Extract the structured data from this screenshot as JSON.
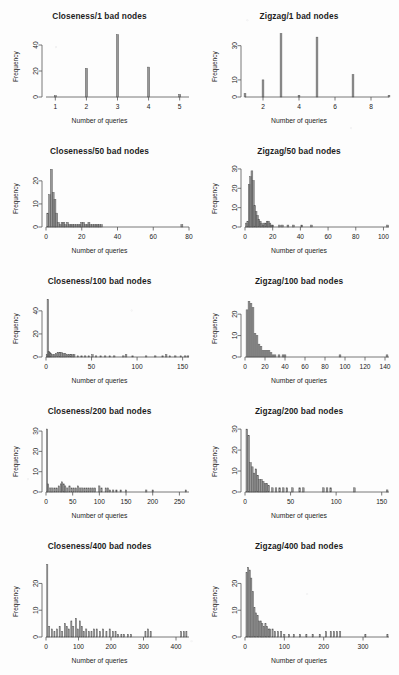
{
  "figure": {
    "axis_color": "#555555",
    "bar_color": "#6f6f6f",
    "background": "#fdfdfd",
    "xlabel": "Number of queries",
    "ylabel": "Frequency"
  },
  "chart_data": [
    {
      "type": "bar",
      "title": "Closeness/1 bad nodes",
      "xlabel": "Number of queries",
      "ylabel": "Frequency",
      "xticks": [
        1,
        2,
        3,
        4,
        5
      ],
      "yticks": [
        0,
        20,
        40
      ],
      "xlim": [
        0.7,
        5.3
      ],
      "ylim": [
        0,
        50
      ],
      "bar_width": 0.07,
      "x": [
        1,
        2,
        3,
        4,
        5
      ],
      "values": [
        1,
        22,
        48,
        23,
        2
      ],
      "grid": false,
      "legend": "none"
    },
    {
      "type": "bar",
      "title": "Zigzag/1 bad nodes",
      "xlabel": "Number of queries",
      "ylabel": "Frequency",
      "xticks": [
        2,
        4,
        6,
        8
      ],
      "yticks": [
        0,
        10,
        30
      ],
      "xlim": [
        1,
        9
      ],
      "ylim": [
        0,
        38
      ],
      "bar_width": 0.1,
      "x": [
        1,
        2,
        3,
        4,
        5,
        7,
        9
      ],
      "values": [
        2,
        10,
        37,
        1,
        35,
        13,
        1
      ],
      "grid": false,
      "legend": "none"
    },
    {
      "type": "bar",
      "title": "Closeness/50 bad nodes",
      "xlabel": "Number of queries",
      "ylabel": "Frequency",
      "xticks": [
        0,
        20,
        40,
        60,
        80
      ],
      "yticks": [
        0,
        10,
        20
      ],
      "xlim": [
        0,
        80
      ],
      "ylim": [
        0,
        26
      ],
      "bar_width": 1.1,
      "x": [
        1,
        2,
        3,
        4,
        5,
        6,
        7,
        8,
        9,
        10,
        11,
        12,
        13,
        14,
        15,
        16,
        17,
        18,
        19,
        20,
        21,
        22,
        23,
        24,
        25,
        26,
        27,
        28,
        29,
        30,
        31,
        76
      ],
      "values": [
        6,
        14,
        25,
        15,
        12,
        6,
        2,
        1,
        2,
        2,
        1,
        2,
        1,
        1,
        1,
        1,
        1,
        1,
        1,
        2,
        2,
        1,
        1,
        2,
        1,
        1,
        1,
        1,
        1,
        1,
        1,
        1
      ],
      "grid": false,
      "legend": "none"
    },
    {
      "type": "bar",
      "title": "Zigzag/50 bad nodes",
      "xlabel": "Number of queries",
      "ylabel": "Frequency",
      "xticks": [
        0,
        20,
        40,
        60,
        80,
        100
      ],
      "yticks": [
        0,
        10,
        20,
        30
      ],
      "xlim": [
        0,
        104
      ],
      "ylim": [
        0,
        31
      ],
      "bar_width": 1.3,
      "x": [
        1,
        2,
        3,
        4,
        5,
        6,
        7,
        8,
        9,
        10,
        11,
        12,
        13,
        14,
        15,
        16,
        17,
        18,
        19,
        20,
        25,
        27,
        31,
        35,
        41,
        48,
        103
      ],
      "values": [
        2,
        3,
        22,
        26,
        29,
        24,
        11,
        8,
        6,
        4,
        3,
        2,
        1,
        2,
        2,
        3,
        3,
        2,
        1,
        1,
        1,
        1,
        1,
        1,
        1,
        1,
        1
      ],
      "grid": false,
      "legend": "none"
    },
    {
      "type": "bar",
      "title": "Closeness/100 bad nodes",
      "xlabel": "Number of queries",
      "ylabel": "Frequency",
      "xticks": [
        0,
        50,
        100,
        150
      ],
      "yticks": [
        0,
        20,
        40
      ],
      "xlim": [
        0,
        157
      ],
      "ylim": [
        0,
        52
      ],
      "bar_width": 1.6,
      "x": [
        1,
        2,
        3,
        4,
        5,
        7,
        9,
        11,
        13,
        15,
        17,
        19,
        21,
        23,
        25,
        27,
        29,
        31,
        35,
        39,
        43,
        47,
        51,
        55,
        60,
        65,
        70,
        75,
        85,
        88,
        95,
        110,
        120,
        128,
        132,
        136,
        142,
        148,
        153,
        156
      ],
      "values": [
        2,
        50,
        5,
        4,
        3,
        2,
        2,
        3,
        4,
        4,
        4,
        3,
        3,
        2,
        2,
        2,
        2,
        2,
        1,
        1,
        1,
        1,
        2,
        1,
        1,
        1,
        1,
        1,
        1,
        2,
        1,
        1,
        1,
        1,
        2,
        1,
        1,
        1,
        1,
        1
      ],
      "grid": false,
      "legend": "none"
    },
    {
      "type": "bar",
      "title": "Zigzag/100 bad nodes",
      "xlabel": "Number of queries",
      "ylabel": "Frequency",
      "xticks": [
        0,
        20,
        40,
        60,
        80,
        100,
        120,
        140
      ],
      "yticks": [
        0,
        10,
        20
      ],
      "xlim": [
        0,
        144
      ],
      "ylim": [
        0,
        28
      ],
      "bar_width": 1.8,
      "x": [
        2,
        4,
        6,
        8,
        10,
        12,
        14,
        16,
        18,
        20,
        22,
        24,
        26,
        28,
        30,
        34,
        38,
        40,
        95,
        142
      ],
      "values": [
        22,
        26,
        25,
        23,
        11,
        10,
        6,
        5,
        3,
        3,
        3,
        3,
        2,
        1,
        1,
        1,
        1,
        1,
        1,
        1
      ],
      "grid": false,
      "legend": "none"
    },
    {
      "type": "bar",
      "title": "Closeness/200 bad nodes",
      "xlabel": "Number of queries",
      "ylabel": "Frequency",
      "xticks": [
        0,
        50,
        100,
        150,
        200,
        250
      ],
      "yticks": [
        0,
        10,
        20,
        30
      ],
      "xlim": [
        0,
        268
      ],
      "ylim": [
        0,
        32
      ],
      "bar_width": 2.4,
      "x": [
        2,
        4,
        8,
        12,
        16,
        20,
        24,
        28,
        30,
        33,
        36,
        40,
        44,
        48,
        52,
        56,
        60,
        64,
        68,
        72,
        76,
        80,
        84,
        88,
        92,
        100,
        104,
        112,
        116,
        120,
        126,
        132,
        140,
        150,
        188,
        200,
        262
      ],
      "values": [
        31,
        4,
        2,
        2,
        2,
        2,
        3,
        4,
        5,
        4,
        3,
        2,
        3,
        2,
        2,
        2,
        3,
        2,
        2,
        2,
        2,
        2,
        2,
        2,
        2,
        3,
        2,
        2,
        2,
        1,
        1,
        1,
        1,
        1,
        1,
        1,
        1
      ],
      "grid": false,
      "legend": "none"
    },
    {
      "type": "bar",
      "title": "Zigzag/200 bad nodes",
      "xlabel": "Number of queries",
      "ylabel": "Frequency",
      "xticks": [
        0,
        50,
        100,
        150
      ],
      "yticks": [
        0,
        10,
        20,
        30
      ],
      "xlim": [
        0,
        158
      ],
      "ylim": [
        0,
        31
      ],
      "bar_width": 1.8,
      "x": [
        2,
        4,
        6,
        8,
        10,
        12,
        14,
        16,
        18,
        20,
        22,
        24,
        26,
        30,
        34,
        38,
        42,
        46,
        52,
        60,
        64,
        86,
        90,
        94,
        120,
        156
      ],
      "values": [
        30,
        27,
        14,
        12,
        9,
        11,
        8,
        6,
        6,
        5,
        4,
        4,
        3,
        2,
        2,
        2,
        2,
        2,
        2,
        2,
        2,
        2,
        2,
        2,
        2,
        1
      ],
      "grid": false,
      "legend": "none"
    },
    {
      "type": "bar",
      "title": "Closeness/400 bad nodes",
      "xlabel": "Number of queries",
      "ylabel": "Frequency",
      "xticks": [
        0,
        100,
        200,
        300,
        400
      ],
      "yticks": [
        0,
        10,
        20
      ],
      "xlim": [
        0,
        440
      ],
      "ylim": [
        0,
        28
      ],
      "bar_width": 3.4,
      "x": [
        4,
        10,
        18,
        26,
        34,
        42,
        50,
        58,
        64,
        70,
        78,
        84,
        92,
        98,
        104,
        110,
        116,
        124,
        132,
        140,
        148,
        156,
        166,
        176,
        186,
        196,
        206,
        214,
        222,
        232,
        240,
        252,
        262,
        306,
        314,
        322,
        416,
        424,
        432
      ],
      "values": [
        27,
        4,
        3,
        2,
        3,
        4,
        2,
        5,
        4,
        3,
        6,
        4,
        7,
        3,
        6,
        4,
        2,
        3,
        2,
        2,
        3,
        3,
        2,
        3,
        2,
        3,
        2,
        2,
        1,
        1,
        1,
        1,
        1,
        2,
        3,
        2,
        2,
        2,
        2
      ],
      "grid": false,
      "legend": "none"
    },
    {
      "type": "bar",
      "title": "Zigzag/400 bad nodes",
      "xlabel": "Number of queries",
      "ylabel": "Frequency",
      "xticks": [
        0,
        100,
        200,
        300
      ],
      "yticks": [
        0,
        10,
        20
      ],
      "xlim": [
        0,
        366
      ],
      "ylim": [
        0,
        28
      ],
      "bar_width": 3.0,
      "x": [
        4,
        8,
        12,
        16,
        20,
        24,
        28,
        32,
        36,
        40,
        44,
        48,
        52,
        56,
        60,
        64,
        70,
        76,
        84,
        92,
        100,
        112,
        124,
        140,
        156,
        172,
        190,
        206,
        218,
        226,
        234,
        242,
        306,
        362
      ],
      "values": [
        24,
        26,
        25,
        22,
        17,
        11,
        9,
        8,
        6,
        6,
        5,
        4,
        5,
        4,
        3,
        3,
        3,
        2,
        2,
        2,
        1,
        1,
        1,
        1,
        1,
        1,
        1,
        2,
        2,
        2,
        2,
        2,
        1,
        1
      ],
      "grid": false,
      "legend": "none"
    }
  ]
}
